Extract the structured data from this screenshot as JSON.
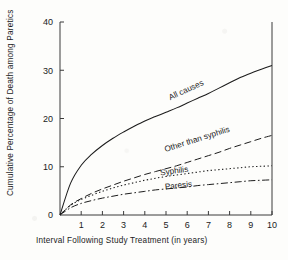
{
  "chart_data": {
    "type": "line",
    "title": "",
    "xlabel": "Interval Following Study Treatment (in years)",
    "ylabel": "Cumulative Percentage of Death among Paretics",
    "xlim": [
      0,
      10
    ],
    "ylim": [
      0,
      40
    ],
    "xticks": [
      0,
      1,
      2,
      3,
      4,
      5,
      6,
      7,
      8,
      9,
      10
    ],
    "xtick_labels": [
      "0",
      "1",
      "2",
      "3",
      "4",
      "5",
      "6",
      "7",
      "8",
      "9",
      "10"
    ],
    "yticks": [
      0,
      10,
      20,
      30,
      40
    ],
    "ytick_labels": [
      "0",
      "10",
      "20",
      "30",
      "40"
    ],
    "grid": false,
    "legend": "inline-curve-labels",
    "x": [
      0,
      0.5,
      1,
      1.5,
      2,
      2.5,
      3,
      3.5,
      4,
      4.5,
      5,
      5.5,
      6,
      6.5,
      7,
      7.5,
      8,
      8.5,
      9,
      9.5,
      10
    ],
    "series": [
      {
        "name": "All causes",
        "style": "solid",
        "label_x": 6.0,
        "label_y": 25.4,
        "values": [
          0,
          6.6,
          10.3,
          12.6,
          14.4,
          15.9,
          17.2,
          18.4,
          19.5,
          20.4,
          21.3,
          22.2,
          23.2,
          24.2,
          25.2,
          26.3,
          27.4,
          28.5,
          29.4,
          30.2,
          31.0
        ]
      },
      {
        "name": "Other than syphilis",
        "style": "long-dash",
        "label_x": 6.5,
        "label_y": 15.2,
        "values": [
          0,
          2.1,
          3.4,
          4.5,
          5.4,
          6.2,
          7.0,
          7.7,
          8.4,
          9.0,
          9.6,
          10.2,
          10.9,
          11.6,
          12.3,
          13.0,
          13.8,
          14.5,
          15.2,
          15.9,
          16.5
        ]
      },
      {
        "name": "Syphilis",
        "style": "dotted",
        "label_x": 5.4,
        "label_y": 8.6,
        "values": [
          0,
          2.0,
          3.2,
          4.1,
          4.9,
          5.6,
          6.2,
          6.7,
          7.2,
          7.6,
          8.0,
          8.3,
          8.6,
          8.9,
          9.2,
          9.4,
          9.6,
          9.8,
          10.0,
          10.1,
          10.2
        ]
      },
      {
        "name": "Paresis",
        "style": "dash-dot",
        "label_x": 5.6,
        "label_y": 5.6,
        "values": [
          0,
          1.5,
          2.4,
          3.0,
          3.5,
          3.9,
          4.3,
          4.6,
          4.9,
          5.2,
          5.4,
          5.6,
          5.8,
          6.1,
          6.3,
          6.5,
          6.7,
          6.9,
          7.1,
          7.2,
          7.3
        ]
      }
    ]
  },
  "figure": {
    "axis_color": "#3a3a3a",
    "curve_color": "#1c1c1c",
    "background": "#fdfdfb"
  }
}
